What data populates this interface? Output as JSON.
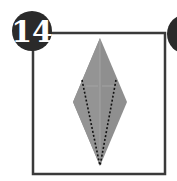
{
  "step": {
    "number": "14",
    "next_step_visible": true
  },
  "colors": {
    "frame": "#3a3a3a",
    "badge": "#2a2a2a",
    "badge_text": "#ffffff",
    "paper": "#8f8f8f",
    "paper_light": "#a3a3a3",
    "dash": "#111111"
  },
  "diagram": {
    "shape": "kite-diamond",
    "fold_lines": "valley-fold dashed lines from upper edges converging to bottom point"
  }
}
